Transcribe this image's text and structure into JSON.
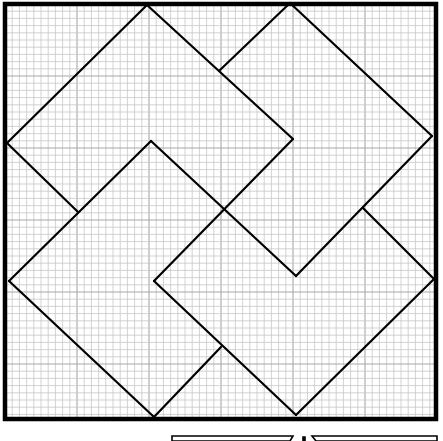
{
  "diagram": {
    "colors": {
      "background": "#ffffff",
      "grid_minor": "#c8c8c8",
      "grid_major": "#a8a8a8",
      "outline": "#000000"
    },
    "frame": {
      "x": 5,
      "y": 4,
      "width": 431,
      "height": 415,
      "stroke_width": 4.5
    },
    "grid": {
      "minor_spacing": 7.2,
      "major_every": 10
    },
    "segments": [
      [
        147,
        5,
        7,
        143
      ],
      [
        147,
        5,
        293,
        139
      ],
      [
        7,
        143,
        78,
        212
      ],
      [
        293,
        139,
        154,
        281
      ],
      [
        151,
        141,
        296,
        276
      ],
      [
        290,
        3,
        220,
        70
      ],
      [
        290,
        3,
        432,
        136
      ],
      [
        432,
        136,
        296,
        276
      ],
      [
        363,
        208,
        434,
        279
      ],
      [
        151,
        141,
        9,
        281
      ],
      [
        9,
        281,
        154,
        417
      ],
      [
        154,
        417,
        221,
        347
      ],
      [
        154,
        281,
        296,
        415
      ],
      [
        296,
        415,
        434,
        279
      ]
    ],
    "bottom_shapes": [
      {
        "name": "left-trapezoid",
        "points": "172,441 172,436 293,436 290,441"
      },
      {
        "name": "right-trapezoid",
        "points": "316,441 312,436 437,436 437,441"
      },
      {
        "name": "tick-mark",
        "points": "303,437 305,437 305,441 303,441"
      }
    ]
  }
}
